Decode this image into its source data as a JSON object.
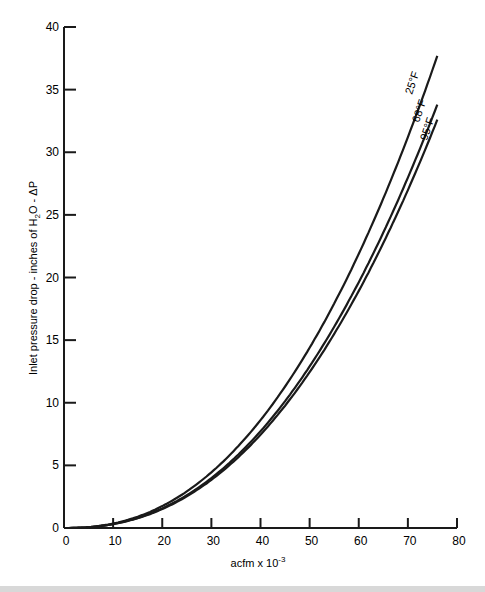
{
  "chart_data": {
    "type": "line",
    "title": "",
    "xlabel": "acfm x 10^-3",
    "ylabel": "Inlet pressure drop - inches of H2O - ΔP",
    "xlim": [
      0,
      80
    ],
    "ylim": [
      0,
      40
    ],
    "xticks": [
      0,
      10,
      20,
      30,
      40,
      50,
      60,
      70,
      80
    ],
    "yticks": [
      0,
      5,
      10,
      15,
      20,
      25,
      30,
      35,
      40
    ],
    "grid": false,
    "legend": "inline labels at curve ends",
    "x": [
      0,
      5,
      10,
      15,
      20,
      25,
      30,
      35,
      40,
      45,
      50,
      55,
      60,
      65,
      70,
      76
    ],
    "series": [
      {
        "name": "25°F",
        "values": [
          0,
          0.08,
          0.36,
          0.91,
          1.75,
          2.93,
          4.45,
          6.35,
          8.65,
          11.35,
          14.45,
          18.0,
          21.9,
          26.3,
          31.1,
          37.7
        ]
      },
      {
        "name": "68°F",
        "values": [
          0,
          0.07,
          0.33,
          0.82,
          1.58,
          2.63,
          4.0,
          5.7,
          7.75,
          10.2,
          13.0,
          16.2,
          19.7,
          23.6,
          27.9,
          33.8
        ]
      },
      {
        "name": "95°F",
        "values": [
          0,
          0.07,
          0.31,
          0.78,
          1.5,
          2.5,
          3.8,
          5.45,
          7.4,
          9.75,
          12.4,
          15.4,
          18.8,
          22.5,
          26.6,
          32.6
        ]
      }
    ]
  }
}
